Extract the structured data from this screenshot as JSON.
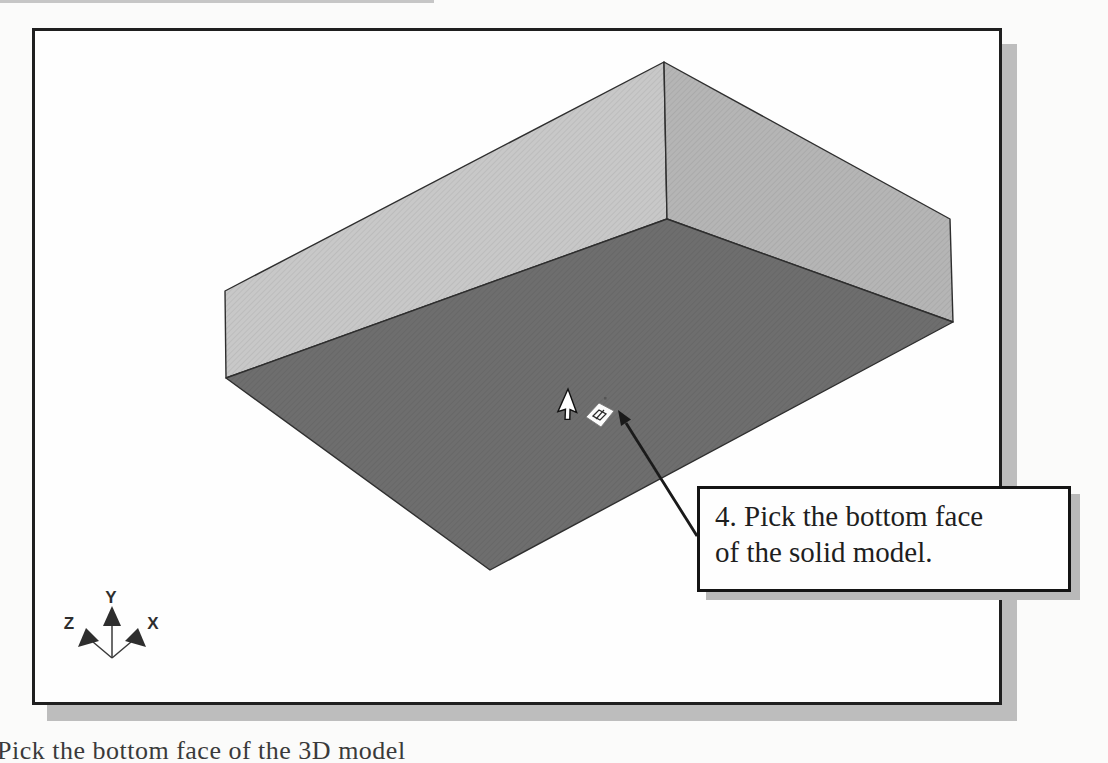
{
  "figure": {
    "callout": {
      "text_line1": "4. Pick the bottom face",
      "text_line2": "of the solid model."
    },
    "triad": {
      "x_label": "X",
      "y_label": "Y",
      "z_label": "Z"
    },
    "model": {
      "face_colors": {
        "left": "#c8c8c8",
        "right": "#b5b5b5",
        "bottom": "#6e6e6e"
      },
      "edge_color": "#2f2f2f"
    },
    "caption_partial": "Pick the bottom face of the 3D model"
  },
  "colors": {
    "frame_border": "#1f1f1f",
    "frame_shadow": "#bdbdbd",
    "callout_border": "#141414",
    "callout_shadow": "#b9b9b9"
  },
  "icons": {
    "cursor": "arrow-cursor-icon",
    "face_select": "face-select-icon",
    "triad": "orientation-triad-icon",
    "leader": "leader-arrow-icon"
  }
}
